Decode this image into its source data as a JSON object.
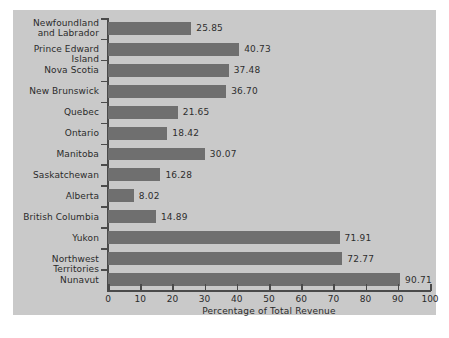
{
  "chart_data": {
    "type": "bar",
    "orientation": "horizontal",
    "title": "",
    "xlabel": "Percentage of Total Revenue",
    "ylabel": "",
    "xlim": [
      0,
      100
    ],
    "xticks": [
      0,
      10,
      20,
      30,
      40,
      50,
      60,
      70,
      80,
      90,
      100
    ],
    "grid": false,
    "legend": null,
    "categories": [
      "Newfoundland\nand Labrador",
      "Prince Edward Island",
      "Nova Scotia",
      "New Brunswick",
      "Quebec",
      "Ontario",
      "Manitoba",
      "Saskatchewan",
      "Alberta",
      "British Columbia",
      "Yukon",
      "Northwest Territories",
      "Nunavut"
    ],
    "values": [
      25.85,
      40.73,
      37.48,
      36.7,
      21.65,
      18.42,
      30.07,
      16.28,
      8.02,
      14.89,
      71.91,
      72.77,
      90.71
    ],
    "value_labels": [
      "25.85",
      "40.73",
      "37.48",
      "36.70",
      "21.65",
      "18.42",
      "30.07",
      "16.28",
      "8.02",
      "14.89",
      "71.91",
      "72.77",
      "90.71"
    ],
    "colors": {
      "bar": "#6f6f6f",
      "panel_background": "#c9c9c9",
      "page_background": "#ffffff",
      "axis": "#4a4a4a",
      "text": "#2b2b2b"
    }
  }
}
